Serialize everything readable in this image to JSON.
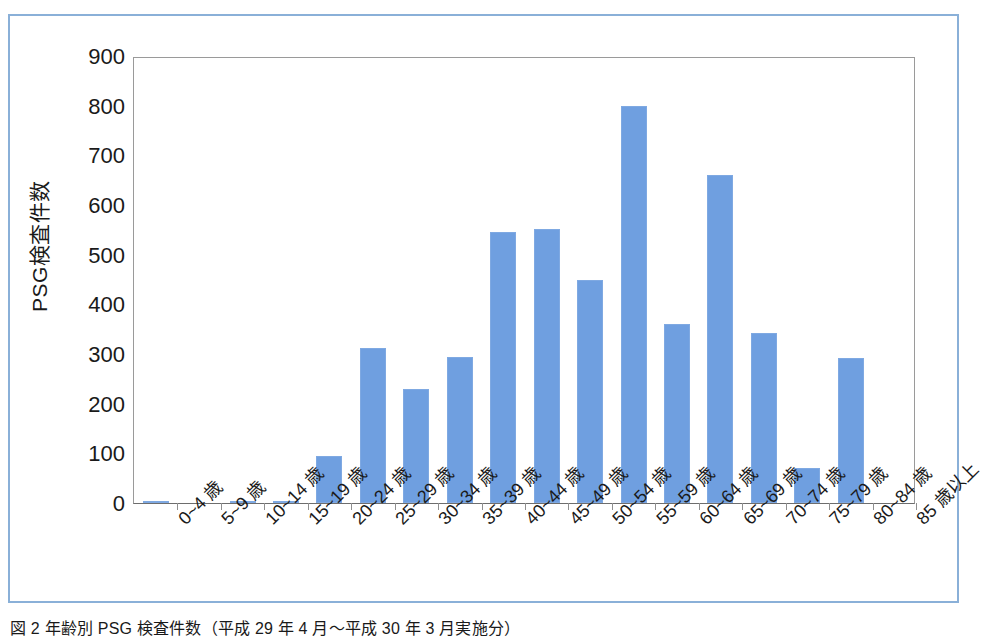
{
  "figure": {
    "caption": "図 2    年齢別 PSG 検査件数（平成 29 年 4 月～平成 30 年 3 月実施分）",
    "border_color": "#8ab0d8"
  },
  "chart_data": {
    "type": "bar",
    "title": "",
    "xlabel": "",
    "ylabel": "PSG検査件数",
    "ylim": [
      0,
      900
    ],
    "ytick_step": 100,
    "ytick_labels": [
      "900",
      "800",
      "700",
      "600",
      "500",
      "400",
      "300",
      "200",
      "100",
      "0"
    ],
    "yticks": [
      900,
      800,
      700,
      600,
      500,
      400,
      300,
      200,
      100,
      0
    ],
    "grid": false,
    "legend": false,
    "bar_color": "#6f9fe0",
    "categories": [
      "0~4 歳",
      "5~9 歳",
      "10~14 歳",
      "15~19 歳",
      "20~24 歳",
      "25~29 歳",
      "30~34 歳",
      "35~39 歳",
      "40~44 歳",
      "45~49 歳",
      "50~54 歳",
      "55~59 歳",
      "60~64 歳",
      "65~69 歳",
      "70~74 歳",
      "75~79 歳",
      "80~84 歳",
      "85 歳以上"
    ],
    "values": [
      4,
      0,
      5,
      3,
      95,
      313,
      229,
      293,
      545,
      552,
      450,
      800,
      360,
      661,
      343,
      70,
      291,
      0
    ]
  }
}
